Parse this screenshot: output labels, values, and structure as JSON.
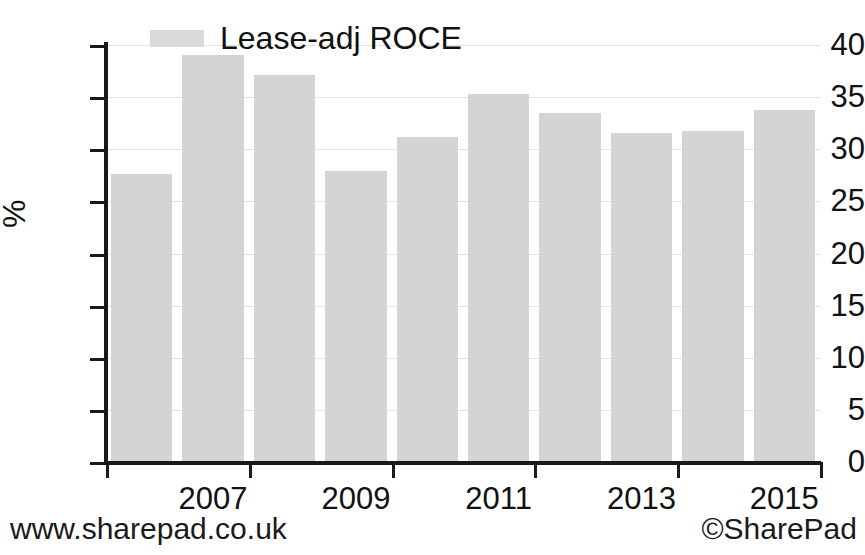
{
  "chart_data": {
    "type": "bar",
    "title": "",
    "subtitle": "",
    "xlabel": "",
    "ylabel": "%",
    "categories": [
      "2006",
      "2007",
      "2008",
      "2009",
      "2010",
      "2011",
      "2012",
      "2013",
      "2014",
      "2015"
    ],
    "series": [
      {
        "name": "Lease-adj ROCE",
        "color": "#d4d4d4",
        "values": [
          27.6,
          39.0,
          37.1,
          27.9,
          31.2,
          35.3,
          33.5,
          31.6,
          31.8,
          33.8
        ]
      }
    ],
    "ylim": [
      0,
      40
    ],
    "xlim_labels": [
      "2007",
      "2009",
      "2011",
      "2013",
      "2015"
    ],
    "ytick_labels": [
      "0",
      "5",
      "10",
      "15",
      "20",
      "25",
      "30",
      "35",
      "40"
    ],
    "yticks": [
      0,
      5,
      10,
      15,
      20,
      25,
      30,
      35,
      40
    ],
    "xticks_shown": [
      {
        "label": "2007",
        "category_index": 1
      },
      {
        "label": "2009",
        "category_index": 3
      },
      {
        "label": "2011",
        "category_index": 5
      },
      {
        "label": "2013",
        "category_index": 7
      },
      {
        "label": "2015",
        "category_index": 9
      }
    ],
    "grid": "horizontal",
    "grid_color": "#e3e3e3",
    "legend_position": "top-left",
    "legend": [
      {
        "label": "Lease-adj ROCE",
        "color": "#d4d4d4"
      }
    ]
  },
  "legend": {
    "label": "Lease-adj ROCE"
  },
  "axis": {
    "y_title": "%"
  },
  "footer": {
    "left": "www.sharepad.co.uk",
    "right": "©SharePad"
  }
}
